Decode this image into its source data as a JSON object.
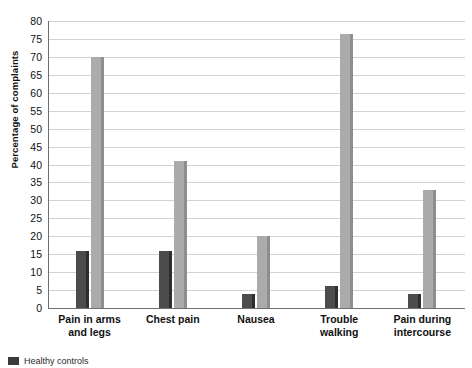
{
  "chart_data": {
    "type": "bar",
    "title": "",
    "xlabel": "",
    "ylabel": "Percentage of complaints",
    "ylim": [
      0,
      80
    ],
    "ytick_step": 5,
    "yticks": [
      0,
      5,
      10,
      15,
      20,
      25,
      30,
      35,
      40,
      45,
      50,
      55,
      60,
      65,
      70,
      75,
      80
    ],
    "grid": true,
    "legend_position": "bottom-left",
    "categories": [
      "Pain in arms\nand legs",
      "Chest pain",
      "Nausea",
      "Trouble\nwalking",
      "Pain during\nintercourse"
    ],
    "series": [
      {
        "name": "Healthy controls",
        "color": "#4c4c4c",
        "values": [
          16,
          16,
          4,
          6,
          4
        ]
      },
      {
        "name": "Patients",
        "color": "#ababab",
        "values": [
          70,
          41,
          20,
          76.5,
          33
        ]
      }
    ]
  },
  "legend": {
    "items": [
      {
        "label": "Healthy controls",
        "color": "#3b3b3b"
      }
    ]
  },
  "axis": {
    "y_title": "Percentage of complaints"
  }
}
